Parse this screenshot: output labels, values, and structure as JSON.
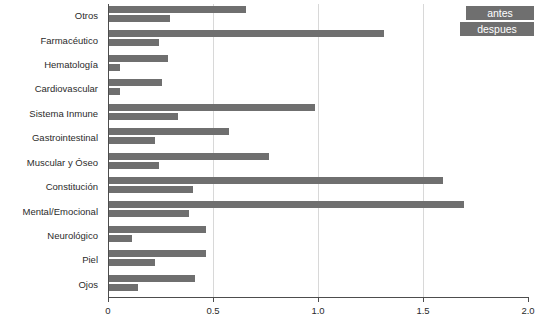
{
  "legend": {
    "position": "top-right",
    "entries": [
      {
        "label": "antes",
        "color": "#6f6f6f"
      },
      {
        "label": "despues",
        "color": "#6f6f6f"
      }
    ]
  },
  "axis": {
    "tick_labels": [
      "0",
      "0.5",
      "1.0",
      "1.5",
      "2.0"
    ],
    "tick_values": [
      0,
      0.5,
      1.0,
      1.5,
      2.0
    ]
  },
  "chart_data": {
    "type": "bar",
    "orientation": "horizontal",
    "title": "",
    "xlabel": "",
    "ylabel": "",
    "xlim": [
      0,
      2.0
    ],
    "xticks": [
      0,
      0.5,
      1.0,
      1.5,
      2.0
    ],
    "grid": true,
    "grid_axis": "x",
    "legend_position": "top-right",
    "categories": [
      "Otros",
      "Farmacéutico",
      "Hematología",
      "Cardiovascular",
      "Sistema Inmune",
      "Gastrointestinal",
      "Muscular y Óseo",
      "Constitución",
      "Mental/Emocional",
      "Neurológico",
      "Piel",
      "Ojos"
    ],
    "series": [
      {
        "name": "antes",
        "color": "#6f6f6f",
        "values": [
          0.65,
          1.31,
          0.28,
          0.25,
          0.98,
          0.57,
          0.76,
          1.59,
          1.69,
          0.46,
          0.46,
          0.41
        ]
      },
      {
        "name": "despues",
        "color": "#6f6f6f",
        "values": [
          0.29,
          0.24,
          0.05,
          0.05,
          0.33,
          0.22,
          0.24,
          0.4,
          0.38,
          0.11,
          0.22,
          0.14
        ]
      }
    ]
  }
}
